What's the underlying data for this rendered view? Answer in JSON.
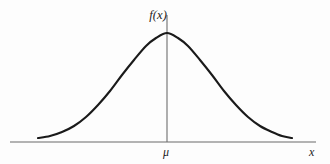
{
  "figure": {
    "background_color": "#fdfdfd"
  },
  "labels": {
    "density_axis": "f(x)",
    "mean_tick": "μ",
    "x_axis": "x"
  },
  "icons": {
    "bell-curve": "bell-curve-icon",
    "axis": "axis-line-icon",
    "mean-line": "vertical-mean-line-icon"
  },
  "colors": {
    "curve": "#1a1a1a",
    "axis": "#9a9a9a",
    "mean_line": "#6e6e6e",
    "text": "#1c1c1c",
    "background": "#fdfdfd"
  },
  "chart_data": {
    "type": "line",
    "title": "",
    "xlabel": "x",
    "ylabel": "f(x)",
    "grid": false,
    "legend": null,
    "annotations": [
      {
        "text": "f(x)",
        "position": "top-center-left-of-axis"
      },
      {
        "text": "μ",
        "position": "below-axis-center"
      },
      {
        "text": "x",
        "position": "right-end-of-axis"
      }
    ],
    "axis_line_y_px": 142,
    "axis_line_x_range_px": [
      10,
      316
    ],
    "mean_line_x_px": 167,
    "mean_line_y_range_px": [
      15,
      142
    ],
    "peak_px": [
      167,
      33
    ],
    "series": [
      {
        "name": "normal-density",
        "points_px": [
          [
            38,
            138
          ],
          [
            50,
            136
          ],
          [
            62,
            132
          ],
          [
            74,
            126
          ],
          [
            86,
            117
          ],
          [
            98,
            105
          ],
          [
            110,
            91
          ],
          [
            122,
            75
          ],
          [
            134,
            60
          ],
          [
            146,
            46
          ],
          [
            156,
            38
          ],
          [
            167,
            33
          ],
          [
            178,
            38
          ],
          [
            188,
            46
          ],
          [
            200,
            60
          ],
          [
            212,
            75
          ],
          [
            224,
            91
          ],
          [
            236,
            105
          ],
          [
            248,
            117
          ],
          [
            260,
            126
          ],
          [
            272,
            132
          ],
          [
            282,
            136
          ],
          [
            292,
            138
          ]
        ]
      }
    ]
  }
}
